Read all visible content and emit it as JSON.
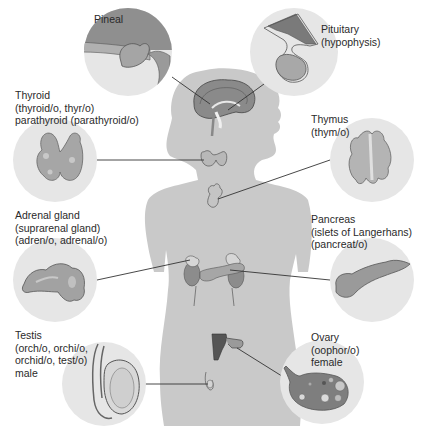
{
  "diagram": {
    "type": "anatomy-endocrine-system",
    "colors": {
      "background": "#ffffff",
      "body_silhouette": "#c9c9c9",
      "circle_fill": "#e4e4e4",
      "organ_fill": "#a9a9a9",
      "organ_dark": "#6e6e6e",
      "outline": "#555555",
      "leader_line": "#333333",
      "text": "#2a2a2a"
    },
    "glands": [
      {
        "id": "pineal",
        "lines": [
          "Pineal"
        ]
      },
      {
        "id": "pituitary",
        "lines": [
          "Pituitary",
          "(hypophysis)"
        ]
      },
      {
        "id": "thyroid",
        "lines": [
          "Thyroid",
          "(thyroid/o, thyr/o)",
          "parathyroid (parathyroid/o)"
        ]
      },
      {
        "id": "thymus",
        "lines": [
          "Thymus",
          "(thym/o)"
        ]
      },
      {
        "id": "adrenal",
        "lines": [
          "Adrenal gland",
          "(suprarenal gland)",
          "(adren/o, adrenal/o)"
        ]
      },
      {
        "id": "pancreas",
        "lines": [
          "Pancreas",
          "(islets of Langerhans)",
          "(pancreat/o)"
        ]
      },
      {
        "id": "testis",
        "lines": [
          "Testis",
          "(orch/o, orchi/o,",
          "orchid/o, test/o)",
          "male"
        ]
      },
      {
        "id": "ovary",
        "lines": [
          "Ovary",
          "(oophor/o)",
          "female"
        ]
      }
    ]
  }
}
